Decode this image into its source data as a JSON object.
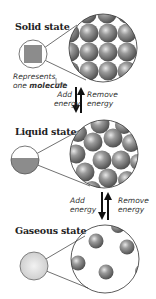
{
  "states": [
    {
      "title": "Solid state"
    },
    {
      "title": "Liquid state"
    },
    {
      "title": "Gaseous state"
    }
  ],
  "legend": {
    "line1": "Represents",
    "line2_prefix": "one ",
    "line2_bold": "molecule"
  },
  "transitions": [
    {
      "add": "Add",
      "add2": "energy",
      "remove": "Remove",
      "remove2": "energy"
    },
    {
      "add": "Add",
      "add2": "energy",
      "remove": "Remove",
      "remove2": "energy"
    }
  ],
  "colors": {
    "molecule": "#7a7a7a",
    "outline": "#333333",
    "swatch": "#8c8c8c"
  }
}
